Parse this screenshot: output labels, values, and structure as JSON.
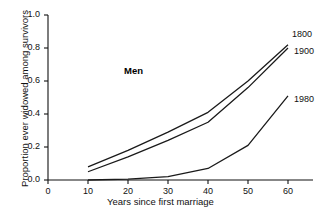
{
  "chart_data": {
    "type": "line",
    "title": "",
    "annotation": "Men",
    "xlabel": "Years since first marriage",
    "ylabel": "Proportion ever widowed among survivors",
    "xlim": [
      0,
      65
    ],
    "ylim": [
      0.0,
      1.0
    ],
    "xticks": [
      0,
      10,
      20,
      30,
      40,
      50,
      60
    ],
    "xtick_labels": [
      "0",
      "10",
      "20",
      "30",
      "40",
      "50",
      "60"
    ],
    "yticks": [
      0.0,
      0.2,
      0.4,
      0.6,
      0.8,
      1.0
    ],
    "ytick_labels": [
      "0.0",
      "0.2",
      "0.4",
      "0.6",
      "0.8",
      "1.0"
    ],
    "grid": false,
    "legend_position": "line-end-labels",
    "x": [
      10,
      20,
      30,
      40,
      50,
      60
    ],
    "series": [
      {
        "name": "1800",
        "label": "1800",
        "color": "#1a1a1a",
        "values": [
          0.08,
          0.18,
          0.29,
          0.41,
          0.6,
          0.82
        ]
      },
      {
        "name": "1900",
        "label": "1900",
        "color": "#1a1a1a",
        "values": [
          0.05,
          0.14,
          0.24,
          0.35,
          0.56,
          0.8
        ]
      },
      {
        "name": "1980",
        "label": "1980",
        "color": "#1a1a1a",
        "values": [
          0.0,
          0.005,
          0.02,
          0.07,
          0.21,
          0.51
        ]
      }
    ]
  },
  "axes": {
    "origin_px": {
      "x": 48,
      "y": 180
    },
    "x_unit_px": 4.0,
    "y_unit_px": 165
  },
  "labels": {
    "series_1800": "1800",
    "series_1900": "1900",
    "series_1980": "1980"
  }
}
